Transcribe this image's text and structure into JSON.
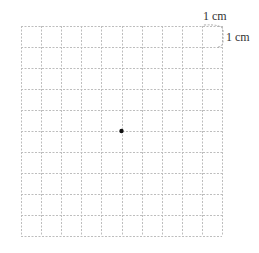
{
  "diagram": {
    "type": "grid-paper",
    "columns": 10,
    "rows": 10,
    "grid": {
      "left": 21,
      "top": 26,
      "right": 222,
      "bottom": 236
    },
    "line_color": "#bdbdbd",
    "line_style": "dashed",
    "point": {
      "col": 5,
      "row": 5,
      "color": "#111111"
    },
    "labels": {
      "top_unit": "1 cm",
      "side_unit": "1 cm"
    }
  }
}
